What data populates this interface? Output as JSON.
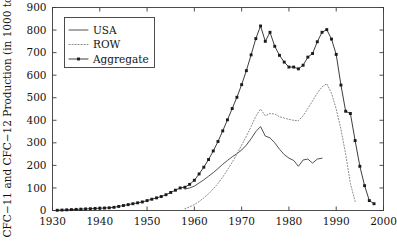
{
  "chart_data": {
    "type": "line",
    "title": "",
    "xlabel": "",
    "ylabel": "CFC−11 and CFC−12 Production (in 1000 tons)",
    "xlim": [
      1930,
      2000
    ],
    "ylim": [
      0,
      900
    ],
    "xticks": [
      1930,
      1940,
      1950,
      1960,
      1970,
      1980,
      1990,
      2000
    ],
    "yticks": [
      0,
      100,
      200,
      300,
      400,
      500,
      600,
      700,
      800,
      900
    ],
    "grid": false,
    "legend_position": "upper-left",
    "series": [
      {
        "name": "USA",
        "style": "solid",
        "marker": "none",
        "color": "#333333",
        "x": [
          1958,
          1959,
          1960,
          1961,
          1962,
          1963,
          1964,
          1965,
          1966,
          1967,
          1968,
          1969,
          1970,
          1971,
          1972,
          1973,
          1974,
          1975,
          1976,
          1977,
          1978,
          1979,
          1980,
          1981,
          1982,
          1983,
          1984,
          1985,
          1986,
          1987
        ],
        "y": [
          95,
          100,
          108,
          122,
          136,
          152,
          168,
          186,
          205,
          222,
          238,
          252,
          268,
          290,
          318,
          350,
          372,
          330,
          322,
          300,
          272,
          248,
          232,
          222,
          196,
          224,
          228,
          210,
          228,
          232
        ],
        "y_units": "1000 tons"
      },
      {
        "name": "ROW",
        "style": "dotted",
        "marker": "none",
        "color": "#8a8a8a",
        "x": [
          1958,
          1959,
          1960,
          1961,
          1962,
          1963,
          1964,
          1965,
          1966,
          1967,
          1968,
          1969,
          1970,
          1971,
          1972,
          1973,
          1974,
          1975,
          1976,
          1977,
          1978,
          1979,
          1980,
          1981,
          1982,
          1983,
          1984,
          1985,
          1986,
          1987,
          1988,
          1989,
          1990,
          1991,
          1992,
          1993,
          1994
        ],
        "y": [
          8,
          16,
          26,
          40,
          56,
          74,
          96,
          120,
          148,
          180,
          214,
          250,
          290,
          330,
          372,
          418,
          450,
          420,
          430,
          428,
          416,
          410,
          404,
          400,
          398,
          420,
          452,
          486,
          520,
          548,
          562,
          520,
          450,
          360,
          250,
          120,
          40
        ],
        "y_units": "1000 tons"
      },
      {
        "name": "Aggregate",
        "style": "solid",
        "marker": "square",
        "color": "#1a1a1a",
        "x": [
          1931,
          1932,
          1933,
          1934,
          1935,
          1936,
          1937,
          1938,
          1939,
          1940,
          1941,
          1942,
          1943,
          1944,
          1945,
          1946,
          1947,
          1948,
          1949,
          1950,
          1951,
          1952,
          1953,
          1954,
          1955,
          1956,
          1957,
          1958,
          1959,
          1960,
          1961,
          1962,
          1963,
          1964,
          1965,
          1966,
          1967,
          1968,
          1969,
          1970,
          1971,
          1972,
          1973,
          1974,
          1975,
          1976,
          1977,
          1978,
          1979,
          1980,
          1981,
          1982,
          1983,
          1984,
          1985,
          1986,
          1987,
          1988,
          1989,
          1990,
          1991,
          1992,
          1993,
          1994,
          1995,
          1996,
          1997,
          1998
        ],
        "y": [
          1,
          2,
          3,
          4,
          5,
          6,
          7,
          8,
          9,
          10,
          11,
          12,
          14,
          18,
          22,
          26,
          30,
          34,
          38,
          44,
          50,
          56,
          62,
          70,
          80,
          90,
          100,
          103,
          116,
          134,
          162,
          192,
          226,
          264,
          306,
          353,
          402,
          452,
          502,
          558,
          620,
          690,
          762,
          818,
          750,
          790,
          728,
          688,
          658,
          636,
          636,
          628,
          644,
          680,
          696,
          748,
          790,
          802,
          760,
          692,
          556,
          440,
          430,
          310,
          196,
          110,
          44,
          30
        ],
        "y_units": "1000 tons"
      }
    ]
  },
  "legend": {
    "entries": [
      {
        "label": "USA",
        "key": "USA"
      },
      {
        "label": "ROW",
        "key": "ROW"
      },
      {
        "label": "Aggregate",
        "key": "Aggregate"
      }
    ]
  },
  "axes": {
    "y_title": "CFC−11 and CFC−12 Production (in 1000 tons)",
    "x_tick_labels": [
      "1930",
      "1940",
      "1950",
      "1960",
      "1970",
      "1980",
      "1990",
      "2000"
    ],
    "y_tick_labels": [
      "0",
      "100",
      "200",
      "300",
      "400",
      "500",
      "600",
      "700",
      "800",
      "900"
    ]
  },
  "colors": {
    "frame": "#3a3a3a",
    "usa": "#333333",
    "row": "#8a8a8a",
    "aggregate": "#1a1a1a",
    "background": "#ffffff"
  }
}
